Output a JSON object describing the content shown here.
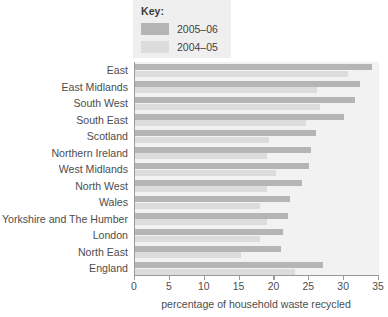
{
  "legend": {
    "title": "Key:",
    "entries": [
      {
        "label": "2005–06",
        "color": "#b5b5b5",
        "key": "new"
      },
      {
        "label": "2004–05",
        "color": "#dcdcdc",
        "key": "old"
      }
    ]
  },
  "chart_data": {
    "type": "bar",
    "orientation": "horizontal",
    "title": "",
    "subtitle": "",
    "xlabel": "percentage of household waste recycled",
    "ylabel": "",
    "xlim": [
      0,
      35
    ],
    "xticks": [
      0,
      5,
      10,
      15,
      20,
      25,
      30,
      35
    ],
    "xticklabels": [
      "0",
      "5",
      "10",
      "15",
      "20",
      "25",
      "30",
      "35"
    ],
    "grid": false,
    "legend_position": "top-center",
    "categories": [
      "East",
      "East Midlands",
      "South West",
      "South East",
      "Scotland",
      "Northern Ireland",
      "West Midlands",
      "North West",
      "Wales",
      "Yorkshire and The Humber",
      "London",
      "North East",
      "England"
    ],
    "series": [
      {
        "name": "2005–06",
        "color": "#b5b5b5",
        "values": [
          34.0,
          32.3,
          31.5,
          30.0,
          26.0,
          25.2,
          25.0,
          24.0,
          22.2,
          22.0,
          21.2,
          21.0,
          27.0
        ]
      },
      {
        "name": "2004–05",
        "color": "#dcdcdc",
        "values": [
          30.6,
          26.1,
          26.6,
          24.5,
          19.2,
          19.0,
          20.2,
          19.0,
          18.0,
          19.0,
          18.0,
          15.2,
          23.0
        ]
      }
    ]
  }
}
